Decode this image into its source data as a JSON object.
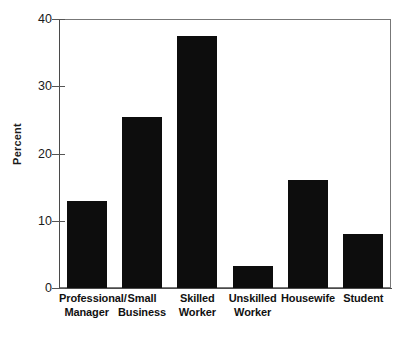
{
  "chart_data": {
    "type": "bar",
    "title": "",
    "xlabel": "",
    "ylabel": "Percent",
    "ylim": [
      0,
      40
    ],
    "yticks": [
      0,
      10,
      20,
      30,
      40
    ],
    "ytick_labels": [
      "0",
      "10",
      "20",
      "30",
      "40"
    ],
    "grid": false,
    "legend": null,
    "categories": [
      "Professional/ Manager",
      "Small Business",
      "Skilled Worker",
      "Unskilled Worker",
      "Housewife",
      "Student"
    ],
    "category_lines": [
      [
        "Professional/",
        "Manager"
      ],
      [
        "Small",
        "Business"
      ],
      [
        "Skilled",
        "Worker"
      ],
      [
        "Unskilled",
        "Worker"
      ],
      [
        "Housewife",
        ""
      ],
      [
        "Student",
        ""
      ]
    ],
    "values": [
      13.0,
      25.5,
      37.5,
      3.3,
      16.0,
      8.0
    ],
    "bar_color": "#0d0d0d",
    "axis_color": "#4a4a4a",
    "frame_color": "#777777",
    "background_color": "#ffffff"
  }
}
